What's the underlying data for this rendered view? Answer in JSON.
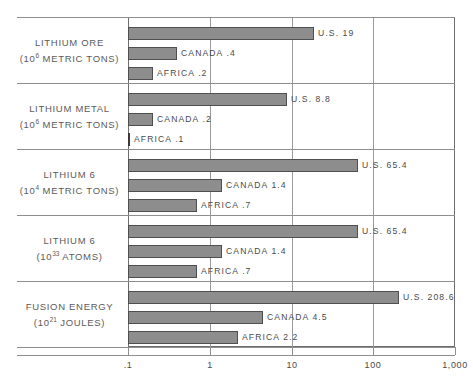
{
  "chart_data": {
    "type": "bar",
    "orientation": "horizontal",
    "title": "",
    "xlabel": "",
    "ylabel": "",
    "xscale": "log",
    "xlim": [
      0.1,
      1000
    ],
    "xticks": [
      0.1,
      1,
      10,
      100,
      1000
    ],
    "xticklabels": [
      ".1",
      "1",
      "10",
      "100",
      "1,000"
    ],
    "grid": true,
    "legend": "none",
    "categories": [
      "U.S.",
      "CANADA",
      "AFRICA"
    ],
    "groups": [
      {
        "label_line1": "LITHIUM ORE",
        "label_line2_pre": "(10",
        "label_line2_sup": "6",
        "label_line2_post": " METRIC TONS)",
        "bars": [
          {
            "name": "U.S.",
            "value": 19,
            "label": "U.S. 19"
          },
          {
            "name": "CANADA",
            "value": 0.4,
            "label": "CANADA .4"
          },
          {
            "name": "AFRICA",
            "value": 0.2,
            "label": "AFRICA .2"
          }
        ]
      },
      {
        "label_line1": "LITHIUM METAL",
        "label_line2_pre": "(10",
        "label_line2_sup": "6",
        "label_line2_post": " METRIC TONS)",
        "bars": [
          {
            "name": "U.S.",
            "value": 8.8,
            "label": "U.S. 8.8"
          },
          {
            "name": "CANADA",
            "value": 0.2,
            "label": "CANADA .2"
          },
          {
            "name": "AFRICA",
            "value": 0.1,
            "label": "AFRICA .1"
          }
        ]
      },
      {
        "label_line1": "LITHIUM 6",
        "label_line2_pre": "(10",
        "label_line2_sup": "4",
        "label_line2_post": " METRIC TONS)",
        "bars": [
          {
            "name": "U.S.",
            "value": 65.4,
            "label": "U.S. 65.4"
          },
          {
            "name": "CANADA",
            "value": 1.4,
            "label": "CANADA 1.4"
          },
          {
            "name": "AFRICA",
            "value": 0.7,
            "label": "AFRICA .7"
          }
        ]
      },
      {
        "label_line1": "LITHIUM 6",
        "label_line2_pre": "(10",
        "label_line2_sup": "33",
        "label_line2_post": " ATOMS)",
        "bars": [
          {
            "name": "U.S.",
            "value": 65.4,
            "label": "U.S. 65.4"
          },
          {
            "name": "CANADA",
            "value": 1.4,
            "label": "CANADA 1.4"
          },
          {
            "name": "AFRICA",
            "value": 0.7,
            "label": "AFRICA .7"
          }
        ]
      },
      {
        "label_line1": "FUSION ENERGY",
        "label_line2_pre": "(10",
        "label_line2_sup": "21",
        "label_line2_post": " JOULES)",
        "bars": [
          {
            "name": "U.S.",
            "value": 208.6,
            "label": "U.S. 208.6"
          },
          {
            "name": "CANADA",
            "value": 4.5,
            "label": "CANADA 4.5"
          },
          {
            "name": "AFRICA",
            "value": 2.2,
            "label": "AFRICA 2.2"
          }
        ]
      }
    ],
    "colors": {
      "bar_fill": "#8d8d8d",
      "bar_stroke": "#4f4f4f",
      "grid": "#9a9a9a",
      "frame": "#6e6e6e",
      "text": "#4a4a4a",
      "background": "#ffffff"
    }
  }
}
